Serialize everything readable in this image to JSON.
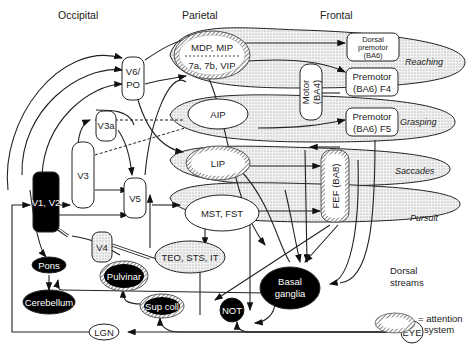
{
  "headers": {
    "occipital": "Occipital",
    "parietal": "Parietal",
    "frontal": "Frontal"
  },
  "streams": {
    "reaching": "Reaching",
    "grasping": "Grasping",
    "saccades": "Saccades",
    "pursuit": "Pursuit"
  },
  "nodes": {
    "v1v2": "V1, V2",
    "v3": "V3",
    "v3a": "V3a",
    "v6po_1": "V6/",
    "v6po_2": "PO",
    "v5": "V5",
    "v4": "V4",
    "mdp_mip": "MDP, MIP",
    "sevena": "7a, 7b, VIP",
    "aip": "AIP",
    "lip": "LIP",
    "mst_fst": "MST, FST",
    "teo": "TEO, STS, IT",
    "dorsal_pm_1": "Dorsal",
    "dorsal_pm_2": "premotor",
    "dorsal_pm_3": "(BA6)",
    "pm_f4_1": "Premotor",
    "pm_f4_2": "(BA6) F4",
    "pm_f5_1": "Premotor",
    "pm_f5_2": "(BA6) F5",
    "motor_1": "Motor",
    "motor_2": "(BA4)",
    "fef": "FEF (BA8)",
    "pons": "Pons",
    "cerebellum": "Cerebellum",
    "pulvinar": "Pulvinar",
    "supcoll": "Sup coll",
    "not": "NOT",
    "basal_1": "Basal",
    "basal_2": "ganglia",
    "lgn": "LGN",
    "eye": "EYE"
  },
  "legend": {
    "dorsal_1": "Dorsal",
    "dorsal_2": "streams",
    "attention_1": "= attention",
    "attention_2": "system"
  }
}
